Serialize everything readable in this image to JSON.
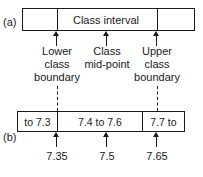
{
  "figure": {
    "panel_a_letter": "(a)",
    "panel_b_letter": "(b)"
  },
  "panel_a": {
    "interval_label": "Class interval",
    "captions": {
      "lower": {
        "line1": "Lower",
        "line2": "class",
        "line3": "boundary"
      },
      "mid": {
        "line1": "Class",
        "line2": "mid-point"
      },
      "upper": {
        "line1": "Upper",
        "line2": "class",
        "line3": "boundary"
      }
    }
  },
  "panel_b": {
    "cells": [
      {
        "label": "to 7.3"
      },
      {
        "label": "7.4 to 7.6"
      },
      {
        "label": "7.7 to"
      }
    ],
    "tick_values": [
      {
        "value": "7.35"
      },
      {
        "value": "7.5"
      },
      {
        "value": "7.65"
      }
    ]
  },
  "chart_data": {
    "type": "diagram",
    "class_interval_label": "Class interval",
    "annotations": [
      {
        "name": "lower class boundary",
        "text": "Lower class boundary",
        "value": 7.35
      },
      {
        "name": "class mid-point",
        "text": "Class mid-point",
        "value": 7.5
      },
      {
        "name": "upper class boundary",
        "text": "Upper class boundary",
        "value": 7.65
      }
    ],
    "classes": [
      "to 7.3",
      "7.4 to 7.6",
      "7.7 to"
    ],
    "stroke_color": "#1a1a1a",
    "background_color": "#ffffff"
  }
}
